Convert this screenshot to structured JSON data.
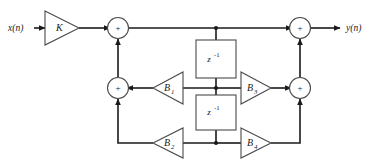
{
  "diagram": {
    "io": {
      "input_label": "x(n)",
      "output_label": "y(n)"
    },
    "adders": [
      {
        "id": "sum-top-left",
        "symbol": "+",
        "x": 118,
        "y": 28
      },
      {
        "id": "sum-top-right",
        "symbol": "+",
        "x": 300,
        "y": 28
      },
      {
        "id": "sum-bottom-left",
        "symbol": "+",
        "x": 118,
        "y": 88
      },
      {
        "id": "sum-bottom-right",
        "symbol": "+",
        "x": 300,
        "y": 88
      }
    ],
    "gains": [
      {
        "id": "gain-k",
        "label": "K",
        "direction": "right",
        "x": 62,
        "y": 28
      },
      {
        "id": "gain-b1",
        "label": "B",
        "subscript": "1",
        "direction": "left",
        "x": 168,
        "y": 88
      },
      {
        "id": "gain-b2",
        "label": "B",
        "subscript": "2",
        "direction": "left",
        "x": 168,
        "y": 143
      },
      {
        "id": "gain-b3",
        "label": "B",
        "subscript": "3",
        "direction": "right",
        "x": 256,
        "y": 88
      },
      {
        "id": "gain-b4",
        "label": "B",
        "subscript": "4",
        "direction": "right",
        "x": 256,
        "y": 143
      }
    ],
    "delays": [
      {
        "id": "delay-upper",
        "base": "z",
        "exponent": "-1",
        "x": 216,
        "y": 59
      },
      {
        "id": "delay-lower",
        "base": "z",
        "exponent": "-1",
        "x": 216,
        "y": 112
      }
    ],
    "junctions": [
      {
        "id": "tap-top",
        "x": 216,
        "y": 28
      },
      {
        "id": "tap-middle",
        "x": 216,
        "y": 88
      },
      {
        "id": "tap-bottom",
        "x": 216,
        "y": 143
      }
    ],
    "colors": {
      "wire": "#1a1a1a",
      "shape_stroke": "#4a4a4a",
      "background": "#ffffff"
    }
  }
}
